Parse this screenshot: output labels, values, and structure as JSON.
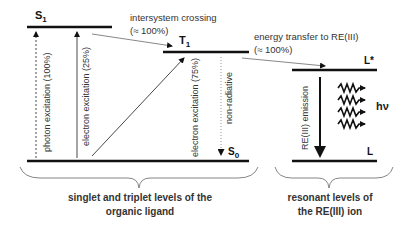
{
  "levels": {
    "S1": {
      "label": "S",
      "sub": "1"
    },
    "T1": {
      "label": "T",
      "sub": "1"
    },
    "S0": {
      "label": "S",
      "sub": "0"
    },
    "Lstar": {
      "label": "L*"
    },
    "L": {
      "label": "L"
    }
  },
  "transitions": {
    "intersystem_crossing": {
      "line1": "intersystem crossing",
      "line2": "(≈ 100%)"
    },
    "energy_transfer": {
      "line1": "energy transfer to RE(III)",
      "line2": "(≈ 100%)"
    },
    "photon_excitation": "photon excitation (100%)",
    "electron_excitation_singlet": "electron excitation (25%)",
    "electron_excitation_triplet": "electron excitation (75%)",
    "non_radiative": "non-radiative",
    "re_emission": "RE(III) emission",
    "photon_emission": "hν"
  },
  "groups": {
    "ligand": {
      "line1": "singlet and triplet levels of the",
      "line2": "organic ligand"
    },
    "ion": {
      "line1": "resonant levels of",
      "line2": "the RE(III) ion"
    }
  }
}
